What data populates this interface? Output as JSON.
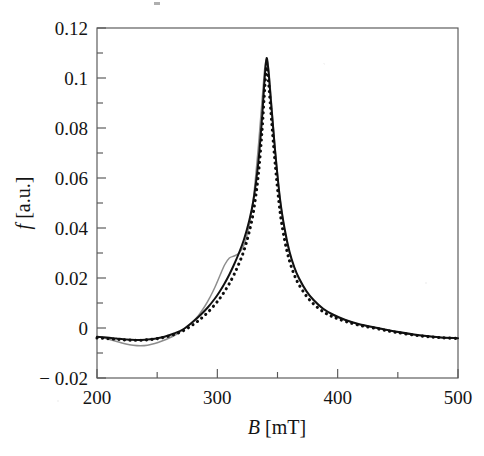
{
  "figure": {
    "background_color": "#ffffff",
    "frame_color": "#575757"
  },
  "chart_data": {
    "type": "line",
    "title": "",
    "subtitle": "",
    "xlabel": "B [mT]",
    "xlabel_symbol": "B",
    "xlabel_unit": "[mT]",
    "ylabel": "f [a.u.]",
    "ylabel_symbol": "f",
    "ylabel_unit": "[a.u.]",
    "xlim": [
      200,
      500
    ],
    "ylim": [
      -0.02,
      0.12
    ],
    "grid": false,
    "legend": null,
    "legend_position": "none",
    "x_ticks_major": [
      200,
      300,
      400,
      500
    ],
    "x_ticklabels": [
      "200",
      "300",
      "400",
      "500"
    ],
    "x_ticks_minor": [
      250,
      350,
      450
    ],
    "y_ticks_major": [
      -0.02,
      0,
      0.02,
      0.04,
      0.06,
      0.08,
      0.1,
      0.12
    ],
    "y_ticklabels": [
      "− 0.02",
      "0",
      "0.02",
      "0.04",
      "0.06",
      "0.08",
      "0.1",
      "0.12"
    ],
    "y_ticks_minor": [
      -0.01,
      0.01,
      0.03,
      0.05,
      0.07,
      0.09,
      0.11
    ],
    "peak_center_mT": 341,
    "peak_height": 0.108,
    "baseline": -0.004,
    "series": [
      {
        "name": "gray-curve",
        "style": "solid",
        "color": "#8d8d8d",
        "x": [
          200,
          206,
          212,
          218,
          224,
          230,
          236,
          242,
          248,
          254,
          260,
          266,
          272,
          278,
          284,
          290,
          294,
          298,
          302,
          306,
          310,
          314,
          318,
          322,
          326,
          330,
          334,
          337,
          339,
          340,
          341,
          342,
          343,
          345,
          348,
          352,
          356,
          360,
          364,
          368,
          374,
          380,
          388,
          396,
          406,
          418,
          432,
          448,
          468,
          484,
          500
        ],
        "y": [
          -0.0035,
          -0.004,
          -0.0048,
          -0.0056,
          -0.0064,
          -0.0069,
          -0.0071,
          -0.0069,
          -0.0062,
          -0.0052,
          -0.004,
          -0.0025,
          -0.0006,
          0.0018,
          0.0048,
          0.009,
          0.0124,
          0.0163,
          0.0208,
          0.0252,
          0.028,
          0.0288,
          0.03,
          0.033,
          0.04,
          0.052,
          0.072,
          0.09,
          0.102,
          0.106,
          0.1075,
          0.106,
          0.102,
          0.09,
          0.072,
          0.052,
          0.039,
          0.03,
          0.024,
          0.0195,
          0.0145,
          0.011,
          0.0075,
          0.0052,
          0.0032,
          0.0014,
          0.0,
          -0.0015,
          -0.003,
          -0.0038,
          -0.0042
        ]
      },
      {
        "name": "solid-black-curve",
        "style": "solid",
        "color": "#111111",
        "x": [
          200,
          208,
          216,
          224,
          232,
          240,
          248,
          256,
          264,
          272,
          280,
          286,
          292,
          298,
          302,
          306,
          310,
          314,
          318,
          322,
          326,
          330,
          334,
          337,
          339,
          340,
          341,
          342,
          343,
          345,
          348,
          352,
          356,
          360,
          364,
          368,
          374,
          380,
          388,
          396,
          406,
          418,
          432,
          448,
          468,
          484,
          500
        ],
        "y": [
          -0.0035,
          -0.0038,
          -0.0042,
          -0.0046,
          -0.0048,
          -0.0047,
          -0.0043,
          -0.0035,
          -0.0022,
          -0.0004,
          0.0026,
          0.0052,
          0.0082,
          0.0118,
          0.0146,
          0.0178,
          0.0214,
          0.0255,
          0.03,
          0.0352,
          0.042,
          0.051,
          0.066,
          0.083,
          0.0975,
          0.104,
          0.108,
          0.105,
          0.1,
          0.088,
          0.071,
          0.052,
          0.0395,
          0.0305,
          0.0243,
          0.0198,
          0.0148,
          0.0112,
          0.0077,
          0.0054,
          0.0033,
          0.0015,
          0.0001,
          -0.0014,
          -0.0029,
          -0.0037,
          -0.0041
        ]
      },
      {
        "name": "dotted-black-curve",
        "style": "dotted",
        "color": "#0d0d0d",
        "x": [
          200,
          208,
          216,
          224,
          232,
          240,
          248,
          256,
          264,
          272,
          280,
          286,
          292,
          298,
          302,
          306,
          310,
          314,
          318,
          322,
          326,
          330,
          334,
          337,
          339,
          340,
          341,
          342,
          343,
          345,
          348,
          352,
          356,
          360,
          364,
          368,
          374,
          380,
          388,
          396,
          406,
          418,
          432,
          448,
          468,
          484,
          500
        ],
        "y": [
          -0.004,
          -0.0042,
          -0.0045,
          -0.0048,
          -0.0049,
          -0.0048,
          -0.0044,
          -0.0037,
          -0.0026,
          -0.001,
          0.0014,
          0.0036,
          0.0062,
          0.0094,
          0.0118,
          0.0146,
          0.0178,
          0.0215,
          0.0258,
          0.0308,
          0.0375,
          0.0465,
          0.061,
          0.078,
          0.093,
          0.1,
          0.1045,
          0.1015,
          0.096,
          0.0835,
          0.066,
          0.047,
          0.035,
          0.0268,
          0.0212,
          0.0172,
          0.0128,
          0.0096,
          0.0065,
          0.0045,
          0.0027,
          0.0011,
          -0.0002,
          -0.0017,
          -0.0031,
          -0.0038,
          -0.0042
        ]
      }
    ]
  }
}
